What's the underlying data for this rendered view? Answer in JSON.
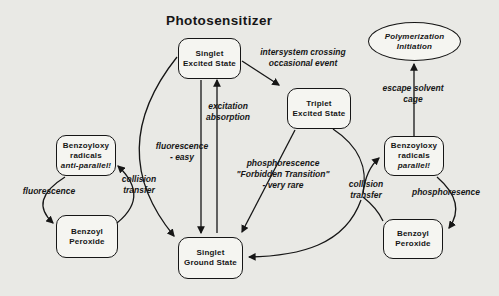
{
  "title": "Photosensitizer",
  "nodes": {
    "singlet_excited_state": {
      "line1": "Singlet",
      "line2": "Excited State"
    },
    "triplet_excited_state": {
      "line1": "Triplet",
      "line2": "Excited State"
    },
    "singlet_ground_state": {
      "line1": "Singlet",
      "line2": "Ground State"
    },
    "benzoyloxy_radicals_antiparallel": {
      "line1": "Benzoyloxy",
      "line2": "radicals",
      "line3": "anti-parallel!"
    },
    "benzoyl_peroxide_left": {
      "line1": "Benzoyl",
      "line2": "Peroxide"
    },
    "benzoyloxy_radicals_parallel": {
      "line1": "Benzoyloxy",
      "line2": "radicals",
      "line3": "parallel!"
    },
    "benzoyl_peroxide_right": {
      "line1": "Benzoyl",
      "line2": "Peroxide"
    },
    "polymerization_initiation": {
      "line1": "Polymerization",
      "line2": "Initiation"
    }
  },
  "edge_labels": {
    "intersystem_crossing": {
      "line1": "intersystem crossing",
      "line2": "occasional event"
    },
    "excitation_absorption": {
      "line1": "excitation",
      "line2": "absorption"
    },
    "fluorescence_easy": {
      "line1": "fluorescence",
      "line2": "- easy"
    },
    "phosphorescence_forbidden": {
      "line1": "phosphorescence",
      "line2": "\"Forbidden Transition\"",
      "line3": "- very rare"
    },
    "collision_transfer_left": {
      "line1": "collision",
      "line2": "transfer"
    },
    "collision_transfer_right": {
      "line1": "collision",
      "line2": "transfer"
    },
    "fluorescence_left": "fluorescence",
    "phosphoresence_right": "phosphoresence",
    "escape_solvent_cage": {
      "line1": "escape solvent",
      "line2": "cage"
    }
  },
  "colors": {
    "ink": "#161616",
    "background": "#e9e9e5",
    "node_fill": "#f5f5f1"
  }
}
